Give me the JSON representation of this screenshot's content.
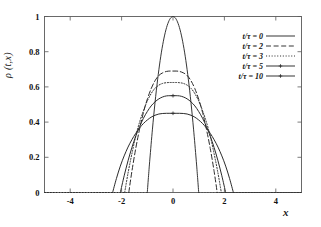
{
  "chart_data": {
    "type": "line",
    "title": "",
    "xlabel": "x",
    "ylabel": "ρ (t,x)",
    "xlim": [
      -5,
      5
    ],
    "ylim": [
      0,
      1
    ],
    "xticks": [
      -4,
      -2,
      0,
      2,
      4
    ],
    "xtick_labels": [
      "-4",
      "-2",
      "0",
      "2",
      "4"
    ],
    "yticks": [
      0,
      0.2,
      0.4,
      0.6,
      0.8,
      1
    ],
    "ytick_labels": [
      "0",
      "0.2",
      "0.4",
      "0.6",
      "0.8",
      "1"
    ],
    "grid": false,
    "legend_position": "top-right",
    "series": [
      {
        "name": "t/τ = 0",
        "style": "solid",
        "marker": "none",
        "peak": 1.0,
        "support": [
          -1.0,
          1.0
        ],
        "x": [
          -1.0,
          -0.95,
          -0.9,
          -0.8,
          -0.7,
          -0.6,
          -0.5,
          -0.4,
          -0.3,
          -0.2,
          -0.1,
          0.0,
          0.1,
          0.2,
          0.3,
          0.4,
          0.5,
          0.6,
          0.7,
          0.8,
          0.9,
          0.95,
          1.0
        ],
        "y": [
          0.0,
          0.098,
          0.19,
          0.36,
          0.51,
          0.64,
          0.75,
          0.84,
          0.91,
          0.96,
          0.99,
          1.0,
          0.99,
          0.96,
          0.91,
          0.84,
          0.75,
          0.64,
          0.51,
          0.36,
          0.19,
          0.098,
          0.0
        ]
      },
      {
        "name": "t/τ = 2",
        "style": "dashed",
        "marker": "none",
        "peak": 0.69,
        "support": [
          -1.72,
          1.72
        ],
        "x": [
          -1.72,
          -1.6,
          -1.45,
          -1.3,
          -1.15,
          -1.0,
          -0.85,
          -0.7,
          -0.55,
          -0.4,
          -0.25,
          -0.12,
          0.0,
          0.12,
          0.25,
          0.4,
          0.55,
          0.7,
          0.85,
          1.0,
          1.15,
          1.3,
          1.45,
          1.6,
          1.72
        ],
        "y": [
          0.0,
          0.12,
          0.25,
          0.36,
          0.455,
          0.53,
          0.59,
          0.635,
          0.665,
          0.68,
          0.688,
          0.69,
          0.69,
          0.69,
          0.688,
          0.68,
          0.665,
          0.635,
          0.59,
          0.53,
          0.455,
          0.36,
          0.25,
          0.12,
          0.0
        ]
      },
      {
        "name": "t/τ = 3",
        "style": "dotted",
        "marker": "none",
        "peak": 0.625,
        "support": [
          -1.88,
          1.88
        ],
        "x": [
          -1.88,
          -1.75,
          -1.6,
          -1.45,
          -1.3,
          -1.15,
          -1.0,
          -0.85,
          -0.7,
          -0.55,
          -0.4,
          -0.25,
          -0.12,
          0.0,
          0.12,
          0.25,
          0.4,
          0.55,
          0.7,
          0.85,
          1.0,
          1.15,
          1.3,
          1.45,
          1.6,
          1.75,
          1.88
        ],
        "y": [
          0.0,
          0.11,
          0.22,
          0.32,
          0.4,
          0.465,
          0.52,
          0.562,
          0.592,
          0.61,
          0.62,
          0.624,
          0.625,
          0.625,
          0.625,
          0.624,
          0.62,
          0.61,
          0.592,
          0.562,
          0.52,
          0.465,
          0.4,
          0.32,
          0.22,
          0.11,
          0.0
        ]
      },
      {
        "name": "t/τ = 5",
        "style": "solid-marker",
        "marker": "plus",
        "peak": 0.55,
        "support": [
          -2.05,
          2.05
        ],
        "x": [
          -2.05,
          -1.9,
          -1.75,
          -1.6,
          -1.45,
          -1.3,
          -1.15,
          -1.0,
          -0.85,
          -0.7,
          -0.55,
          -0.4,
          -0.25,
          -0.12,
          0.0,
          0.12,
          0.25,
          0.4,
          0.55,
          0.7,
          0.85,
          1.0,
          1.15,
          1.3,
          1.45,
          1.6,
          1.75,
          1.9,
          2.05
        ],
        "y": [
          0.0,
          0.095,
          0.18,
          0.255,
          0.32,
          0.375,
          0.422,
          0.46,
          0.492,
          0.515,
          0.532,
          0.543,
          0.549,
          0.55,
          0.55,
          0.55,
          0.549,
          0.543,
          0.532,
          0.515,
          0.492,
          0.46,
          0.422,
          0.375,
          0.32,
          0.255,
          0.18,
          0.095,
          0.0
        ]
      },
      {
        "name": "t/τ = 10",
        "style": "solid-marker",
        "marker": "plus",
        "peak": 0.45,
        "support": [
          -2.35,
          2.35
        ],
        "x": [
          -2.35,
          -2.2,
          -2.05,
          -1.9,
          -1.75,
          -1.6,
          -1.45,
          -1.3,
          -1.15,
          -1.0,
          -0.85,
          -0.7,
          -0.55,
          -0.4,
          -0.25,
          -0.12,
          0.0,
          0.12,
          0.25,
          0.4,
          0.55,
          0.7,
          0.85,
          1.0,
          1.15,
          1.3,
          1.45,
          1.6,
          1.75,
          1.9,
          2.05,
          2.2,
          2.35
        ],
        "y": [
          0.0,
          0.08,
          0.15,
          0.208,
          0.258,
          0.3,
          0.336,
          0.367,
          0.392,
          0.412,
          0.428,
          0.439,
          0.446,
          0.449,
          0.45,
          0.45,
          0.45,
          0.45,
          0.45,
          0.449,
          0.446,
          0.439,
          0.428,
          0.412,
          0.392,
          0.367,
          0.336,
          0.3,
          0.258,
          0.208,
          0.15,
          0.08,
          0.0
        ]
      }
    ]
  },
  "axes": {
    "y_title": "ρ (t,x)",
    "x_title": "x"
  },
  "legend": {
    "entries": [
      {
        "label": "t/τ = 0"
      },
      {
        "label": "t/τ = 2"
      },
      {
        "label": "t/τ = 3"
      },
      {
        "label": "t/τ = 5"
      },
      {
        "label": "t/τ = 10"
      }
    ]
  },
  "colors": {
    "curve": "#2b2b2b",
    "frame": "#5a5a5a",
    "background": "#ffffff"
  }
}
